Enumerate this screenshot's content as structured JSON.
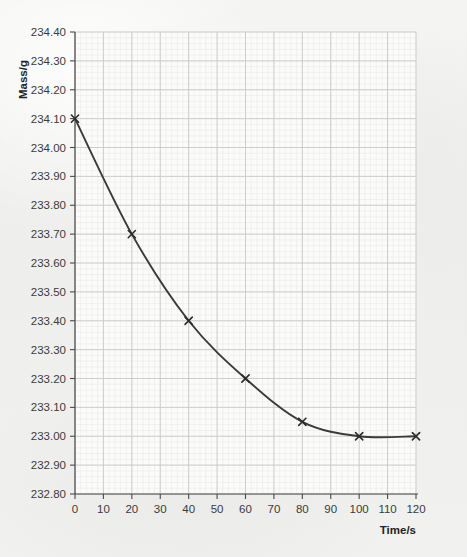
{
  "chart_data": {
    "type": "line",
    "title": "",
    "subtitle": "",
    "xlabel": "Time/s",
    "ylabel": "Mass/g",
    "x": [
      0,
      20,
      40,
      60,
      80,
      100,
      120
    ],
    "values": [
      234.1,
      233.7,
      233.4,
      233.2,
      233.05,
      233.0,
      233.0
    ],
    "series": [
      {
        "name": "Mass vs time",
        "x": [
          0,
          20,
          40,
          60,
          80,
          100,
          120
        ],
        "values": [
          234.1,
          233.7,
          233.4,
          233.2,
          233.05,
          233.0,
          233.0
        ]
      }
    ],
    "xlim": [
      0,
      120
    ],
    "ylim": [
      232.8,
      234.4
    ],
    "x_tick_step": 10,
    "y_tick_step": 0.1,
    "x_minor_per_major": 5,
    "y_minor_per_major": 5,
    "grid": true,
    "grid_minor": true,
    "legend": false,
    "legend_position": "none",
    "marker": "x-cross",
    "line_style": "smooth-solid",
    "annotations": [],
    "x_tick_labels": [
      "0",
      "10",
      "20",
      "30",
      "40",
      "50",
      "60",
      "70",
      "80",
      "90",
      "100",
      "110",
      "120"
    ],
    "y_tick_labels": [
      "232.80",
      "232.90",
      "233.00",
      "233.10",
      "233.20",
      "233.30",
      "233.40",
      "233.50",
      "233.60",
      "233.70",
      "233.80",
      "233.90",
      "234.00",
      "234.10",
      "234.20",
      "234.30",
      "234.40"
    ],
    "colors": {
      "curve": "#3a3a3a",
      "marker": "#2b2b2b",
      "axis": "#4a4a4a",
      "grid_major": "#c9c9c9",
      "grid_minor": "#e6e6e6",
      "plot_background": "#fbfbfa",
      "page_background": "#f2f2f0",
      "text": "#3b3b3b"
    }
  }
}
